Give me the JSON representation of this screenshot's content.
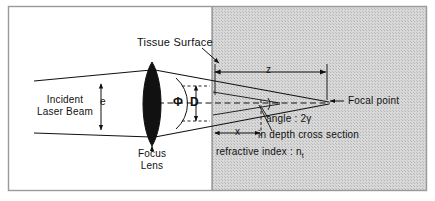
{
  "figure": {
    "background_color": "#ffffff",
    "frame_color": "#9a9a9a",
    "tissue_fill_color": "#d4d4d4",
    "ink_color": "#111111",
    "lens_fill_color": "#111111"
  },
  "labels": {
    "tissue_surface": "Tissue Surface",
    "incident_beam_line1": "Incident",
    "incident_beam_line2": "Laser Beam",
    "beam_diameter_symbol": "e",
    "lens_angle_symbol": "Φ",
    "spot_diameter_symbol": "D",
    "focus_lens_line1": "Focus",
    "focus_lens_line2": "Lens",
    "depth_symbol": "z",
    "distance_symbol": "x",
    "focal_point": "Focal point",
    "angle_label": "angle : 2γ",
    "cross_section_note": "in depth cross section",
    "refractive_index_prefix": "refractive index : n",
    "refractive_index_subscript": "t"
  },
  "geometry": {
    "frame": {
      "x": 8,
      "y": 6,
      "width": 419,
      "height": 185
    },
    "tissue_surface_x": 212,
    "optical_axis_y": 103,
    "lens_center_x": 152,
    "focal_point_x": 329
  }
}
